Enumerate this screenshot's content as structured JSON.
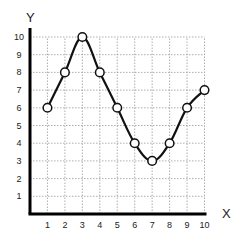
{
  "chart_data": {
    "type": "line",
    "title": "",
    "xlabel": "X",
    "ylabel": "Y",
    "x": [
      1,
      2,
      3,
      4,
      5,
      6,
      7,
      8,
      9,
      10
    ],
    "series": [
      {
        "name": "series-1",
        "values": [
          6,
          8,
          10,
          8,
          6,
          4,
          3,
          4,
          6,
          7
        ]
      }
    ],
    "xlim": [
      0,
      10
    ],
    "ylim": [
      0,
      10
    ],
    "x_ticks": [
      "1",
      "2",
      "3",
      "4",
      "5",
      "6",
      "7",
      "8",
      "9",
      "10"
    ],
    "y_ticks": [
      "1",
      "2",
      "3",
      "4",
      "5",
      "6",
      "7",
      "8",
      "9",
      "10"
    ],
    "grid": true,
    "legend": "none",
    "marker": "open-circle",
    "line_style": "smooth"
  },
  "colors": {
    "line": "#111111",
    "grid": "#999999",
    "axis": "#000000"
  }
}
